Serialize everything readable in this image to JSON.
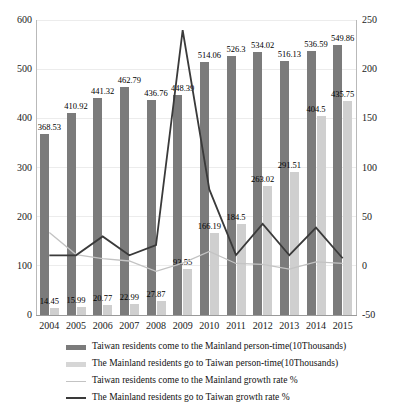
{
  "chart_data": {
    "type": "bar",
    "title": "",
    "subtitle": "",
    "xlabel": "",
    "ylabel": "",
    "categories": [
      "2004",
      "2005",
      "2006",
      "2007",
      "2008",
      "2009",
      "2010",
      "2011",
      "2012",
      "2013",
      "2014",
      "2015"
    ],
    "axes": {
      "left": {
        "min": 0,
        "max": 600,
        "step": 100,
        "ticks": [
          "0",
          "100",
          "200",
          "300",
          "400",
          "500",
          "600"
        ],
        "label": ""
      },
      "right": {
        "min": -50,
        "max": 250,
        "step": 50,
        "ticks": [
          "-50",
          "0",
          "50",
          "100",
          "150",
          "200",
          "250"
        ],
        "label": ""
      }
    },
    "grid": true,
    "legend_position": "bottom",
    "series": [
      {
        "name": "Taiwan residents come to the Mainland person-time(10Thousands)",
        "type": "bar",
        "axis": "left",
        "color": "#7b7b7b",
        "values": [
          368.53,
          410.92,
          441.32,
          462.79,
          436.76,
          448.39,
          514.06,
          526.3,
          534.02,
          516.13,
          536.59,
          549.86
        ],
        "labels": [
          "368.53",
          "410.92",
          "441.32",
          "462.79",
          "436.76",
          "448.39",
          "514.06",
          "526.3",
          "534.02",
          "516.13",
          "536.59",
          "549.86"
        ]
      },
      {
        "name": "The Mainland residents go to Taiwan person-time(10Thousands)",
        "type": "bar",
        "axis": "left",
        "color": "#cfcfcf",
        "values": [
          14.45,
          15.99,
          20.77,
          22.99,
          27.87,
          93.55,
          166.19,
          184.5,
          263.02,
          291.51,
          404.5,
          435.75
        ],
        "labels": [
          "14.45",
          "15.99",
          "20.77",
          "22.99",
          "27.87",
          "93.55",
          "166.19",
          "184.5",
          "263.02",
          "291.51",
          "404.5",
          "435.75"
        ]
      },
      {
        "name": "Taiwan residents come to the Mainland growth rate %",
        "type": "line",
        "axis": "right",
        "color": "#c3c3c3",
        "values": [
          34,
          11.5,
          7.4,
          4.9,
          -5.6,
          2.7,
          14.7,
          2.4,
          1.5,
          -3.4,
          4.0,
          2.5
        ]
      },
      {
        "name": "The Mainland residents go to Taiwan growth rate %",
        "type": "line",
        "axis": "right",
        "color": "#3a3a3a",
        "values": [
          10.6,
          10.7,
          29.9,
          10.7,
          21.2,
          239.6,
          77.7,
          11.0,
          42.6,
          10.8,
          38.8,
          7.7
        ]
      }
    ]
  },
  "legend": {
    "items": [
      {
        "key": "bar-dark",
        "label": "Taiwan residents come to the Mainland person-time(10Thousands)"
      },
      {
        "key": "bar-light",
        "label": "The Mainland residents go to Taiwan person-time(10Thousands)"
      },
      {
        "key": "line-light",
        "label": "Taiwan residents come to the Mainland growth rate %"
      },
      {
        "key": "line-dark",
        "label": "The Mainland residents go to Taiwan growth rate %"
      }
    ]
  }
}
